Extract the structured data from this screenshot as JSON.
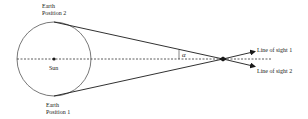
{
  "diagram": {
    "labels": {
      "earth_position_2_line1": "Earth",
      "earth_position_2_line2": "Position 2",
      "earth_position_1_line1": "Earth",
      "earth_position_1_line2": "Position 1",
      "sun": "Sun",
      "angle": "α",
      "line_of_sight_1": "Line of sight 1",
      "line_of_sight_2": "Line of sight 2"
    },
    "colors": {
      "line": "#1a1a1a",
      "orbit": "#555555",
      "background": "#ffffff"
    }
  }
}
